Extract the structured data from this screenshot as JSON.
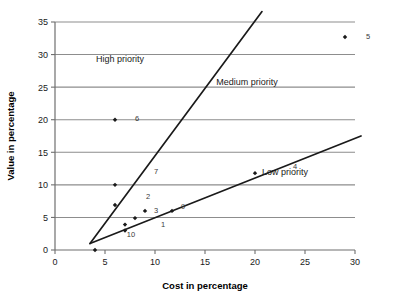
{
  "chart_data": {
    "type": "scatter",
    "title": "",
    "xlabel": "Cost in percentage",
    "ylabel": "Value in percentage",
    "xlim": [
      0,
      30
    ],
    "ylim": [
      0,
      35
    ],
    "xticks": [
      0,
      5,
      10,
      15,
      20,
      25,
      30
    ],
    "yticks": [
      0,
      5,
      10,
      15,
      20,
      25,
      30,
      35
    ],
    "grid": "horizontal",
    "legend": "none",
    "points": [
      {
        "label": "",
        "x": 4.0,
        "y": 0.0
      },
      {
        "label": "6",
        "x": 6.0,
        "y": 20.0
      },
      {
        "label": "",
        "x": 6.0,
        "y": 10.0
      },
      {
        "label": "",
        "x": 6.0,
        "y": 6.9
      },
      {
        "label": "",
        "x": 7.0,
        "y": 3.9
      },
      {
        "label": "10",
        "x": 7.0,
        "y": 3.0
      },
      {
        "label": "",
        "x": 8.0,
        "y": 4.9
      },
      {
        "label": "3",
        "x": 9.0,
        "y": 6.0
      },
      {
        "label": "9",
        "x": 11.7,
        "y": 6.0
      },
      {
        "label": "4",
        "x": 20.0,
        "y": 11.8
      },
      {
        "label": "5",
        "x": 29.0,
        "y": 32.7
      }
    ],
    "point_labels": [
      {
        "text": "5",
        "x": 31.3,
        "y": 32.8
      },
      {
        "text": "6",
        "x": 8.2,
        "y": 20.2
      },
      {
        "text": "7",
        "x": 10.1,
        "y": 12.2
      },
      {
        "text": "2",
        "x": 9.3,
        "y": 8.3
      },
      {
        "text": "3",
        "x": 10.1,
        "y": 6.1
      },
      {
        "text": "9",
        "x": 12.8,
        "y": 6.7
      },
      {
        "text": "1",
        "x": 10.8,
        "y": 4.0
      },
      {
        "text": "10",
        "x": 7.6,
        "y": 2.5
      },
      {
        "text": "4",
        "x": 24.0,
        "y": 12.9
      }
    ],
    "boundary_lines": [
      {
        "name": "high-medium-boundary",
        "x1": 3.5,
        "y1": 1.0,
        "x2": 20.7,
        "y2": 36.6
      },
      {
        "name": "medium-low-boundary",
        "x1": 3.5,
        "y1": 1.0,
        "x2": 30.6,
        "y2": 17.5
      }
    ],
    "regions": [
      {
        "name": "high-priority",
        "label": "High priority",
        "x": 6.5,
        "y": 28.8
      },
      {
        "name": "medium-priority",
        "label": "Medium priority",
        "x": 19.2,
        "y": 25.3
      },
      {
        "name": "low-priority",
        "label": "Low priority",
        "x": 23.0,
        "y": 11.5
      }
    ],
    "colors": {
      "gridline": "#8d8d8d",
      "axis": "#6f6f6f",
      "boundary": "#1a1a1a",
      "marker": "#1a1a1a",
      "text": "#1a1a1a",
      "background": "#ffffff"
    }
  }
}
